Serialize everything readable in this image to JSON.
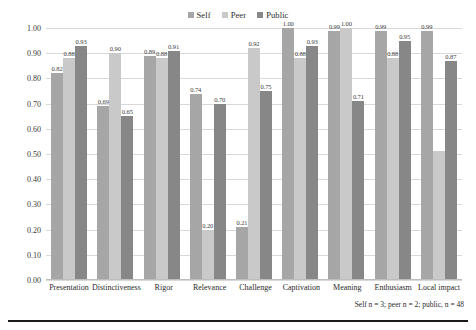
{
  "chart_data": {
    "type": "bar",
    "title": "",
    "xlabel": "",
    "ylabel": "",
    "ylim": [
      0.0,
      1.0
    ],
    "grid": true,
    "legend_position": "top-center",
    "ytick_labels": [
      "1.00",
      "0.90",
      "0.80",
      "0.70",
      "0.60",
      "0.50",
      "0.40",
      "0.30",
      "0.20",
      "0.10",
      "0.00"
    ],
    "ytick_values": [
      1.0,
      0.9,
      0.8,
      0.7,
      0.6,
      0.5,
      0.4,
      0.3,
      0.2,
      0.1,
      0.0
    ],
    "categories": [
      "Presentation",
      "Distinctiveness",
      "Rigor",
      "Relevance",
      "Challenge",
      "Captivation",
      "Meaning",
      "Enthusiasm",
      "Local impact"
    ],
    "series": [
      {
        "name": "Self",
        "color": "#a6a6a6",
        "values": [
          0.82,
          0.69,
          0.89,
          0.74,
          0.21,
          1.0,
          0.99,
          0.99,
          0.99
        ],
        "labels": [
          "0.82",
          "0.69",
          "0.89",
          "0.74",
          "0.21",
          "1.00",
          "0.99",
          "0.99",
          "0.99"
        ]
      },
      {
        "name": "Peer",
        "color": "#c9c9c9",
        "values": [
          0.88,
          0.9,
          0.88,
          0.2,
          0.92,
          0.88,
          1.0,
          0.88,
          0.51
        ],
        "labels": [
          "0.88",
          "0.90",
          "0.88",
          "0.20",
          "0.92",
          "0.88",
          "1.00",
          "0.88",
          ""
        ]
      },
      {
        "name": "Public",
        "color": "#878787",
        "values": [
          0.93,
          0.65,
          0.91,
          0.7,
          0.75,
          0.93,
          0.71,
          0.95,
          0.87
        ],
        "labels": [
          "0.93",
          "0.65",
          "0.91",
          "0.70",
          "0.75",
          "0.93",
          "0.71",
          "0.95",
          "0.87"
        ]
      }
    ],
    "caption": "Self n = 3; peer n = 2; public, n = 48"
  },
  "legend": {
    "items": [
      {
        "label": "Self",
        "color": "#a6a6a6"
      },
      {
        "label": "Peer",
        "color": "#c9c9c9"
      },
      {
        "label": "Public",
        "color": "#878787"
      }
    ]
  },
  "caption_text": "Self n = 3; peer n = 2; public, n = 48"
}
